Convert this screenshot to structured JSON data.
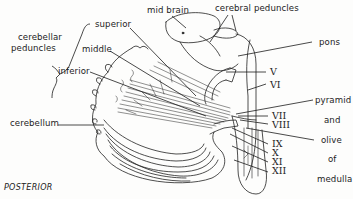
{
  "figure": {
    "orientation_label": "POSTERIOR"
  },
  "labels": {
    "cerebellar_peduncles": {
      "line1": "cerebellar",
      "line2": "peduncles"
    },
    "superior": "superior",
    "middle": "middle",
    "inferior": "inferior",
    "mid_brain": "mid brain",
    "cerebral_peduncles": "cerebral peduncles",
    "pons": "pons",
    "cerebellum": "cerebellum",
    "pyramid": "pyramid",
    "and": "and",
    "olive": "olive",
    "of": "of",
    "medulla": "medulla"
  },
  "cranial_nerves": [
    "V",
    "VI",
    "VII",
    "VIII",
    "IX",
    "X",
    "XI",
    "XII"
  ],
  "colors": {
    "ink": "#1c1c1c",
    "paper": "#fdfdfc"
  }
}
